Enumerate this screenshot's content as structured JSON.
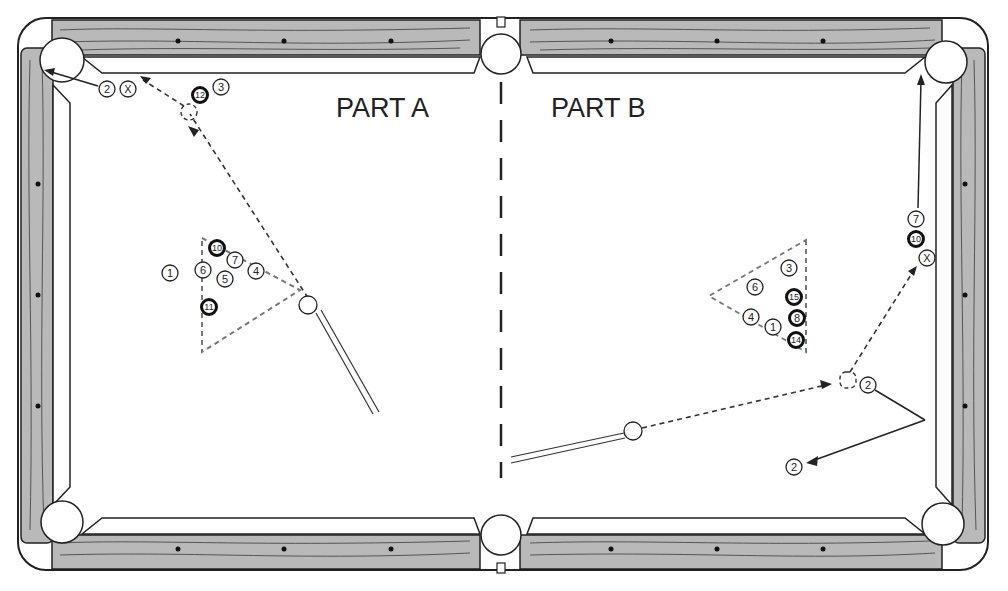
{
  "diagram": {
    "labels": {
      "part_a": "PART A",
      "part_b": "PART B"
    },
    "part_a": {
      "balls": [
        {
          "n": "2",
          "x": 107,
          "y": 89,
          "stripe": false
        },
        {
          "n": "X",
          "x": 128,
          "y": 89,
          "stripe": false
        },
        {
          "n": "12",
          "x": 200,
          "y": 95,
          "stripe": true
        },
        {
          "n": "3",
          "x": 221,
          "y": 87,
          "stripe": false
        },
        {
          "n": "10",
          "x": 217,
          "y": 248,
          "stripe": true
        },
        {
          "n": "7",
          "x": 235,
          "y": 260,
          "stripe": false
        },
        {
          "n": "1",
          "x": 170,
          "y": 273,
          "stripe": false
        },
        {
          "n": "6",
          "x": 203,
          "y": 270,
          "stripe": false
        },
        {
          "n": "5",
          "x": 225,
          "y": 279,
          "stripe": false
        },
        {
          "n": "4",
          "x": 256,
          "y": 271,
          "stripe": false
        },
        {
          "n": "11",
          "x": 209,
          "y": 307,
          "stripe": true
        }
      ],
      "cue_ball": {
        "x": 308,
        "y": 305
      }
    },
    "part_b": {
      "balls": [
        {
          "n": "3",
          "x": 789,
          "y": 268,
          "stripe": false
        },
        {
          "n": "6",
          "x": 755,
          "y": 287,
          "stripe": false
        },
        {
          "n": "15",
          "x": 794,
          "y": 297,
          "stripe": true
        },
        {
          "n": "4",
          "x": 751,
          "y": 317,
          "stripe": false
        },
        {
          "n": "1",
          "x": 773,
          "y": 327,
          "stripe": false
        },
        {
          "n": "8",
          "x": 797,
          "y": 318,
          "stripe": true
        },
        {
          "n": "14",
          "x": 796,
          "y": 340,
          "stripe": true
        },
        {
          "n": "7",
          "x": 916,
          "y": 219,
          "stripe": false
        },
        {
          "n": "10",
          "x": 916,
          "y": 239,
          "stripe": true
        },
        {
          "n": "X",
          "x": 927,
          "y": 258,
          "stripe": false
        },
        {
          "n": "2",
          "x": 868,
          "y": 385,
          "stripe": false
        },
        {
          "n": "2",
          "x": 794,
          "y": 467,
          "stripe": false
        }
      ],
      "cue_ball": {
        "x": 633,
        "y": 431
      }
    }
  }
}
